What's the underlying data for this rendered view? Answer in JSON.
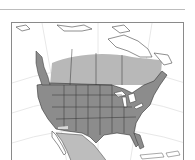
{
  "map": {
    "region": "North America",
    "style": "grayscale range map",
    "colors": {
      "background": "#ffffff",
      "land": "#ffffff",
      "range_primary": "#8c8c8c",
      "range_secondary": "#b8b8b8",
      "borders": "#3a3a3a",
      "graticule": "#e6e6e6",
      "frame": "#8a8a8a"
    },
    "layers": [
      {
        "name": "primary-range",
        "description": "contiguous United States and Pacific coast"
      },
      {
        "name": "secondary-range",
        "description": "southern Canada and Mexico"
      }
    ]
  }
}
